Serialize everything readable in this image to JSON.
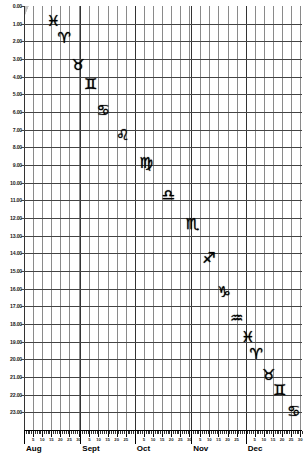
{
  "chart_data": {
    "type": "line",
    "title": "",
    "xlabel": "",
    "ylabel": "",
    "grid": true,
    "legend": "none",
    "ylim": [
      0,
      23.99
    ],
    "y_tick_labels": [
      "0.00",
      "1.00",
      "2.00",
      "3.00",
      "4.00",
      "5.00",
      "6.00",
      "7.00",
      "8.00",
      "9.00",
      "10.00",
      "11.00",
      "12.00",
      "13.00",
      "14.00",
      "15.00",
      "16.00",
      "17.00",
      "18.00",
      "19.00",
      "20.00",
      "21.00",
      "22.00",
      "23.00"
    ],
    "y_tick_values": [
      0,
      1,
      2,
      3,
      4,
      5,
      6,
      7,
      8,
      9,
      10,
      11,
      12,
      13,
      14,
      15,
      16,
      17,
      18,
      19,
      20,
      21,
      22,
      23
    ],
    "x_months": [
      {
        "label": "Aug",
        "days": 31,
        "day_ticks": [
          5,
          10,
          15,
          20,
          25
        ]
      },
      {
        "label": "Sept",
        "days": 30,
        "day_ticks": [
          5,
          10,
          15,
          20,
          25
        ]
      },
      {
        "label": "Oct",
        "days": 31,
        "day_ticks": [
          5,
          10,
          15,
          20,
          25
        ]
      },
      {
        "label": "Nov",
        "days": 30,
        "day_ticks": [
          5,
          10,
          15,
          20,
          25
        ]
      },
      {
        "label": "Dec",
        "days": 31,
        "day_ticks": [
          5,
          10,
          15,
          20,
          25
        ]
      }
    ],
    "band_color": "#c3c3c3",
    "background_color": "#ffffff",
    "band_count": 8,
    "band_slope_note": "bands rise to the right; each band spans ~2.5 months horizontally over full 24h vertical range",
    "series": [
      {
        "name": "zodiac-transit-bands",
        "description": "Diagonal shaded bands marking when each zodiac constellation is above the horizon",
        "points": []
      }
    ],
    "annotations": [
      {
        "symbol": "♓",
        "name": "Pisces",
        "x_pct": 10.5,
        "y_pct": 3.5
      },
      {
        "symbol": "♈",
        "name": "Aries",
        "x_pct": 14.5,
        "y_pct": 7.5
      },
      {
        "symbol": "♉",
        "name": "Taurus",
        "x_pct": 19.5,
        "y_pct": 14.0
      },
      {
        "symbol": "♊",
        "name": "Gemini",
        "x_pct": 24.0,
        "y_pct": 18.5
      },
      {
        "symbol": "♋",
        "name": "Cancer",
        "x_pct": 28.5,
        "y_pct": 24.5
      },
      {
        "symbol": "♌",
        "name": "Leo",
        "x_pct": 35.5,
        "y_pct": 30.5
      },
      {
        "symbol": "♍",
        "name": "Virgo",
        "x_pct": 44.0,
        "y_pct": 37.0
      },
      {
        "symbol": "♎",
        "name": "Libra",
        "x_pct": 52.0,
        "y_pct": 44.5
      },
      {
        "symbol": "♏",
        "name": "Scorpio",
        "x_pct": 60.5,
        "y_pct": 51.5
      },
      {
        "symbol": "♐",
        "name": "Sagittarius",
        "x_pct": 66.5,
        "y_pct": 59.5
      },
      {
        "symbol": "♑",
        "name": "Capricorn",
        "x_pct": 72.0,
        "y_pct": 67.5
      },
      {
        "symbol": "♒",
        "name": "Aquarius",
        "x_pct": 76.5,
        "y_pct": 73.5
      },
      {
        "symbol": "♓",
        "name": "Pisces",
        "x_pct": 80.5,
        "y_pct": 78.0
      },
      {
        "symbol": "♈",
        "name": "Aries",
        "x_pct": 83.5,
        "y_pct": 82.0
      },
      {
        "symbol": "♉",
        "name": "Taurus",
        "x_pct": 88.0,
        "y_pct": 87.0
      },
      {
        "symbol": "♊",
        "name": "Gemini",
        "x_pct": 92.0,
        "y_pct": 90.5
      },
      {
        "symbol": "♋",
        "name": "Cancer",
        "x_pct": 97.0,
        "y_pct": 95.5
      }
    ]
  }
}
